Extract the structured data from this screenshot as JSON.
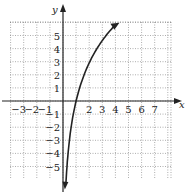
{
  "chart_data": {
    "type": "line",
    "title": "",
    "xlabel": "x",
    "ylabel": "y",
    "xlim": [
      -4,
      8.5
    ],
    "ylim": [
      -6.5,
      6.5
    ],
    "grid": true,
    "x_ticks": [
      "-3",
      "-2",
      "-1",
      "2",
      "3",
      "4",
      "5",
      "6",
      "7"
    ],
    "y_ticks": [
      "5",
      "4",
      "3",
      "2",
      "1",
      "-1",
      "-2",
      "-3",
      "-4",
      "-5"
    ],
    "series": [
      {
        "name": "logarithmic curve",
        "description": "increasing log curve through (1,0), arrows at both ends",
        "points": [
          [
            0.18,
            -6.3
          ],
          [
            0.3,
            -5
          ],
          [
            0.5,
            -3
          ],
          [
            0.75,
            -1.2
          ],
          [
            1,
            0
          ],
          [
            1.5,
            1.75
          ],
          [
            2,
            3
          ],
          [
            2.5,
            3.9
          ],
          [
            3,
            4.7
          ],
          [
            3.5,
            5.3
          ],
          [
            4,
            5.8
          ]
        ]
      }
    ]
  }
}
